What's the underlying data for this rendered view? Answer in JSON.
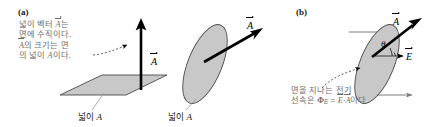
{
  "figure": {
    "width": 436,
    "height": 127,
    "background": "#ffffff",
    "surface_fill": "#c8c8c8",
    "surface_stroke": "#4a4a4a",
    "arrow_color": "#000000",
    "callout_color": "#6d6d6d",
    "leader_color": "#9a9a9a"
  },
  "panels": {
    "a": {
      "label": "(a)",
      "callout_lines": [
        "넓이 벡터 A⃗는",
        "면에 수직이다.",
        "A⃗의 크기는 면",
        "의 넓이 A이다."
      ],
      "callout_text": "넓이 벡터 A⃗는\n면에 수직이다.\nA⃗의 크기는 면\n의 넓이 A이다.",
      "plane": {
        "area_label": "넓이 ",
        "area_symbol": "A",
        "vector_label": "A",
        "vector_direction": "up-vertical"
      },
      "ellipse": {
        "area_label": "넓이 ",
        "area_symbol": "A",
        "vector_label": "A",
        "vector_direction": "up-right"
      }
    },
    "b": {
      "label": "(b)",
      "callout_text": "면을 지나는 전기\n선속은 Φ",
      "callout_line1": "면을 지나는 전기",
      "callout_line2_prefix": "선속은 Φ",
      "callout_sub": "E",
      "callout_line2_suffix": " = E⃗·A⃗이다.",
      "flux_symbol": "Φ",
      "flux_subscript": "E",
      "equals": "=",
      "field_label": "E",
      "area_vector_label": "A",
      "angle_label": "θ",
      "field_arrow_count": 3
    }
  }
}
